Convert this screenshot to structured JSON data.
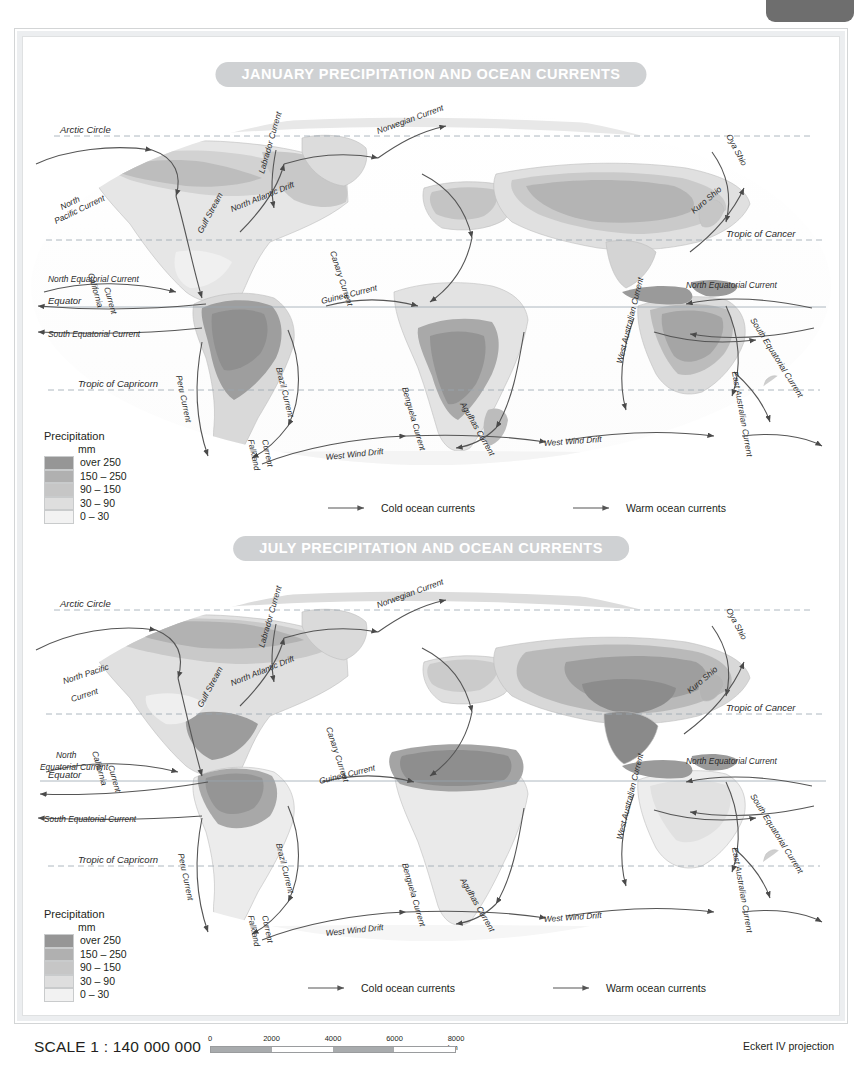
{
  "page": {
    "tab": "",
    "scale_text": "SCALE 1 : 140 000 000",
    "projection": "Eckert IV projection",
    "scalebar": {
      "ticks": [
        "0",
        "2000",
        "4000",
        "6000",
        "8000 km"
      ],
      "unit": "km",
      "segments": 4
    }
  },
  "legend": {
    "title": "Precipitation",
    "unit": "mm",
    "classes": [
      {
        "label": "over 250",
        "color": "#969696"
      },
      {
        "label": "150 – 250",
        "color": "#b0b0b0"
      },
      {
        "label": "90 – 150",
        "color": "#c6c6c6"
      },
      {
        "label": "30 – 90",
        "color": "#dedede"
      },
      {
        "label": "0 – 30",
        "color": "#f2f2f2"
      }
    ],
    "cold_label": "Cold ocean currents",
    "warm_label": "Warm ocean currents"
  },
  "maps": [
    {
      "id": "january",
      "title": "JANUARY PRECIPITATION AND OCEAN CURRENTS",
      "latitudes": [
        "Arctic Circle",
        "Tropic of Cancer",
        "Equator",
        "Tropic of Capricorn"
      ],
      "currents": [
        "North Pacific Current",
        "California Current",
        "North Equatorial Current",
        "South Equatorial Current",
        "Labrador Current",
        "North Atlantic Drift",
        "Gulf Stream",
        "Norwegian Current",
        "Canary Current",
        "Guinea Current",
        "Peru Current",
        "Brazil Current",
        "Falkland Current",
        "Benguela Current",
        "Agulhas Current",
        "West Wind Drift",
        "Oya Shio",
        "Kuro Shio",
        "West Australian Current",
        "East Australian Current"
      ]
    },
    {
      "id": "july",
      "title": "JULY PRECIPITATION AND OCEAN CURRENTS",
      "latitudes": [
        "Arctic Circle",
        "Tropic of Cancer",
        "Equator",
        "Tropic of Capricorn"
      ],
      "currents": [
        "North Pacific Current",
        "California Current",
        "North Equatorial Current",
        "South Equatorial Current",
        "Labrador Current",
        "North Atlantic Drift",
        "Gulf Stream",
        "Norwegian Current",
        "Canary Current",
        "Guinea Current",
        "Peru Current",
        "Brazil Current",
        "Falkland Current",
        "Benguela Current",
        "Agulhas Current",
        "West Wind Drift",
        "Oya Shio",
        "Kuro Shio",
        "West Australian Current",
        "East Australian Current"
      ]
    }
  ]
}
